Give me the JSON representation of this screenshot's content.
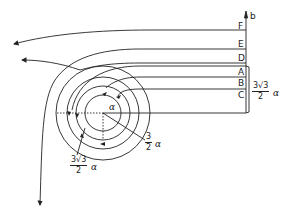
{
  "diagram": {
    "axis_label": "b",
    "streamline_labels": [
      "F",
      "E",
      "D",
      "A",
      "B",
      "C"
    ],
    "center_label": "α",
    "dimension_right": {
      "numerator": "3√3",
      "denominator": "2",
      "symbol": "α"
    },
    "dimension_inner": {
      "numerator": "3",
      "denominator": "2",
      "symbol": "α"
    },
    "dimension_outer": {
      "numerator": "3√3",
      "denominator": "2",
      "symbol": "α"
    },
    "line_color": "#222222",
    "background": "#ffffff"
  }
}
